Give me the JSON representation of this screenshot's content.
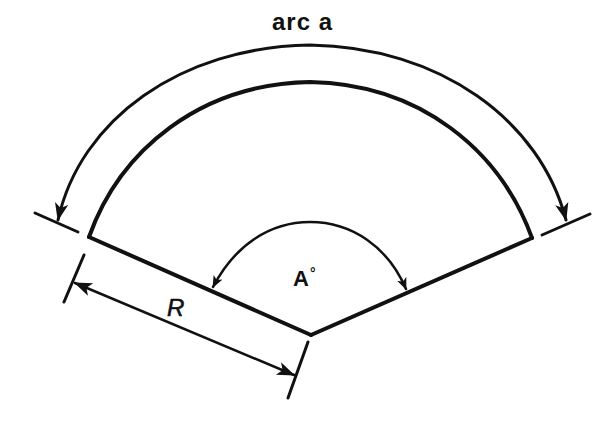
{
  "figure": {
    "type": "circular-sector-diagram",
    "labels": {
      "arc_length": "arc a",
      "angle_symbol": "A",
      "angle_unit": "°",
      "radius": "R"
    },
    "colors": {
      "background": "#ffffff",
      "ink": "#111111"
    },
    "geometry": {
      "apex": [
        311,
        335
      ],
      "left_corner": [
        89,
        237
      ],
      "right_corner": [
        532,
        238
      ],
      "inner_arc_peak_y": 82,
      "outer_arc_peak_y": 45,
      "angle_arc_start": [
        213,
        288
      ],
      "angle_arc_end": [
        406,
        290
      ],
      "angle_arc_peak_y": 222
    },
    "components": [
      "sector-outline",
      "arc-length-dimension",
      "angle-dimension",
      "radius-dimension"
    ]
  }
}
